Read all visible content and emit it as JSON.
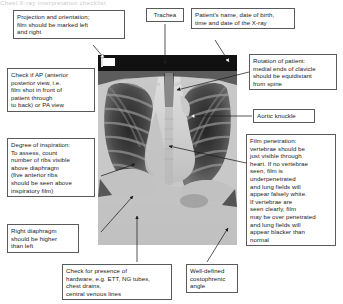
{
  "figure": {
    "title_fragment": "Chest X-ray interpretation checklist",
    "image_label": "chest-xray-frontal"
  },
  "annotations": {
    "projection": {
      "name": "projection-and-orientation",
      "lines": [
        "Projection and orientation;",
        "film should be marked left",
        "and right"
      ]
    },
    "ap_check": {
      "name": "ap-versus-pa-check",
      "lines": [
        "Check if AP (anterior",
        "posterior view, i.e.",
        "film shot in front of",
        "patient through",
        "to back) or PA view"
      ]
    },
    "inspiration": {
      "name": "degree-of-inspiration",
      "lines": [
        "Degree of inspiration:",
        "To assess, count",
        "number of ribs visible",
        "above diaphragm",
        "(five anterior ribs",
        "should be seen above",
        "inspiratory film)"
      ]
    },
    "diaphragm": {
      "name": "right-diaphragm-height",
      "lines": [
        "Right diaphragm",
        "should be higher",
        "than left"
      ]
    },
    "hardware": {
      "name": "hardware-presence-check",
      "lines": [
        "Check for presence of",
        "hardware, e.g. ETT, NG tubes,",
        "chest drains,",
        "central venous lines"
      ]
    },
    "trachea": {
      "name": "trachea-label",
      "lines": [
        "Trachea"
      ]
    },
    "patient_details": {
      "name": "patient-details",
      "lines": [
        "Patient's name, date of birth,",
        "time and date of the X-ray"
      ]
    },
    "rotation": {
      "name": "rotation-of-patient",
      "lines": [
        "Rotation of patient:",
        "medial ends of clavicle",
        "should be equidistant",
        "from spine"
      ]
    },
    "aortic_knuckle": {
      "name": "aortic-knuckle-label",
      "lines": [
        "Aortic knuckle"
      ]
    },
    "penetration": {
      "name": "film-penetration",
      "lines": [
        "Film  penetration:",
        "vertebrae should be",
        "just visible through",
        "heart. If no vertebrae",
        "seen, film is",
        "underpenetrated",
        "and lung fields will",
        "appear falsely white.",
        "If vertebrae are",
        "seen clearly, film",
        "may be over penetrated",
        "and lung fields will",
        "appear blacker than",
        "normal"
      ]
    },
    "costophrenic": {
      "name": "costophrenic-angle",
      "lines": [
        "Well-defined",
        "costophrenic",
        "angle"
      ]
    }
  },
  "colors": {
    "box_border": "#5a5a5a",
    "text": "#1a1a1a",
    "leader_line": "#2b2b2b",
    "page_background": "#ffffff",
    "xray_background": "#d8d8d8"
  }
}
